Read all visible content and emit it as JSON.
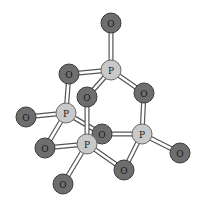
{
  "diagram": {
    "colors": {
      "oxygen": "#6e6e6e",
      "phosphorus": "#c9c9c9"
    },
    "atoms": [
      {
        "id": "O1",
        "el": "O",
        "label": "O",
        "x": 111,
        "y": 23,
        "r": 10
      },
      {
        "id": "P1",
        "el": "P",
        "label": "P",
        "x": 111,
        "y": 70,
        "r": 10
      },
      {
        "id": "O2",
        "el": "O",
        "label": "O",
        "x": 69,
        "y": 74,
        "r": 10
      },
      {
        "id": "O3",
        "el": "O",
        "label": "O",
        "x": 144,
        "y": 93,
        "r": 10
      },
      {
        "id": "O4",
        "el": "O",
        "label": "O",
        "x": 87,
        "y": 97,
        "r": 10
      },
      {
        "id": "P2",
        "el": "P",
        "label": "P",
        "x": 66,
        "y": 113,
        "r": 10
      },
      {
        "id": "O5",
        "el": "O",
        "label": "O",
        "x": 26,
        "y": 117,
        "r": 10
      },
      {
        "id": "O6",
        "el": "O",
        "label": "O",
        "x": 102,
        "y": 134,
        "r": 10
      },
      {
        "id": "P3",
        "el": "P",
        "label": "P",
        "x": 142,
        "y": 134,
        "r": 10
      },
      {
        "id": "O7",
        "el": "O",
        "label": "O",
        "x": 180,
        "y": 153,
        "r": 10
      },
      {
        "id": "O8",
        "el": "O",
        "label": "O",
        "x": 45,
        "y": 148,
        "r": 10
      },
      {
        "id": "P4",
        "el": "P",
        "label": "P",
        "x": 87,
        "y": 144,
        "r": 10
      },
      {
        "id": "O9",
        "el": "O",
        "label": "O",
        "x": 124,
        "y": 170,
        "r": 10
      },
      {
        "id": "O10",
        "el": "O",
        "label": "O",
        "x": 63,
        "y": 184,
        "r": 10
      }
    ],
    "bonds": [
      [
        "O1",
        "P1"
      ],
      [
        "P1",
        "O2"
      ],
      [
        "P1",
        "O3"
      ],
      [
        "P1",
        "O4"
      ],
      [
        "O2",
        "P2"
      ],
      [
        "P2",
        "O5"
      ],
      [
        "P2",
        "O6"
      ],
      [
        "P2",
        "O8"
      ],
      [
        "O4",
        "P4"
      ],
      [
        "O3",
        "P3"
      ],
      [
        "O6",
        "P3"
      ],
      [
        "P3",
        "O7"
      ],
      [
        "P3",
        "O9"
      ],
      [
        "O8",
        "P4"
      ],
      [
        "P4",
        "O9"
      ],
      [
        "P4",
        "O10"
      ]
    ],
    "draw_order": [
      "O1",
      "P1",
      "O2",
      "O3",
      "O6",
      "P2",
      "O5",
      "O4",
      "P3",
      "O7",
      "O8",
      "P4",
      "O9",
      "O10"
    ]
  }
}
